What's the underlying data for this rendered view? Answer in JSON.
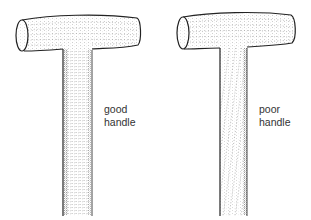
{
  "figure": {
    "handles": [
      {
        "id": "good",
        "label_line1": "good",
        "label_line2": "handle",
        "grain": "straight"
      },
      {
        "id": "poor",
        "label_line1": "poor",
        "label_line2": "handle",
        "grain": "diagonal"
      }
    ]
  },
  "colors": {
    "outline": "#222222",
    "stipple": "#8a8a8a",
    "text": "#333333",
    "background": "#ffffff"
  }
}
